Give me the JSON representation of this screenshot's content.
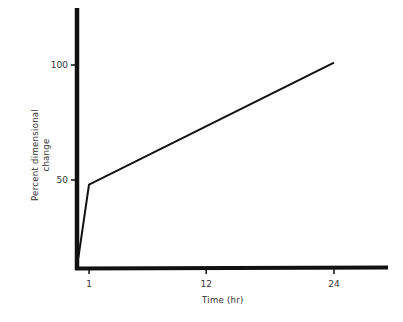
{
  "chart_data": {
    "type": "line",
    "title": "",
    "xlabel": "Time (hr)",
    "ylabel_line1": "Percent dimensional",
    "ylabel_line2": "change",
    "ylabel": "Percent dimensional change",
    "x_ticks": [
      {
        "value": 1,
        "label": "1"
      },
      {
        "value": 12,
        "label": "12"
      },
      {
        "value": 24,
        "label": "24"
      }
    ],
    "y_ticks": [
      {
        "value": 50,
        "label": "50"
      },
      {
        "value": 100,
        "label": "100"
      }
    ],
    "xlim": [
      0,
      28
    ],
    "ylim": [
      12,
      148
    ],
    "grid": false,
    "legend": null,
    "series": [
      {
        "name": "Percent dimensional change",
        "x": [
          0,
          1,
          24
        ],
        "y": [
          16,
          48,
          101
        ]
      }
    ],
    "colors": {
      "line": "#111111",
      "axis": "#111111",
      "background": "#ffffff"
    }
  }
}
